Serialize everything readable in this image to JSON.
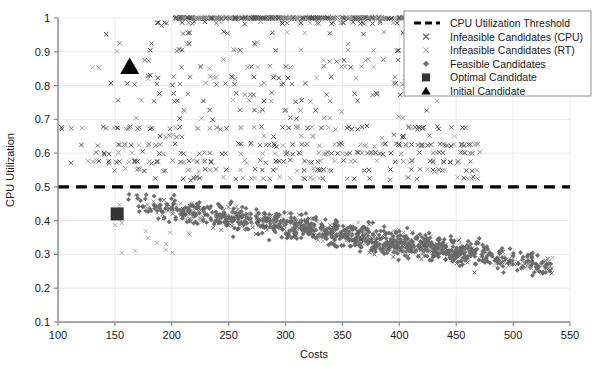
{
  "chart_data": {
    "type": "scatter",
    "title": "",
    "xlabel": "Costs",
    "ylabel": "CPU Utilization",
    "xlim": [
      100,
      550
    ],
    "ylim": [
      0.1,
      1.0
    ],
    "xticks": [
      100,
      150,
      200,
      250,
      300,
      350,
      400,
      450,
      500,
      550
    ],
    "yticks": [
      "0.1",
      "0.2",
      "0.3",
      "0.4",
      "0.5",
      "0.6",
      "0.7",
      "0.8",
      "0.9",
      "1"
    ],
    "grid": true,
    "legend_position": "top-right",
    "threshold": {
      "name": "CPU Utilization Threshold",
      "value": 0.5,
      "style": "dashed",
      "color": "#000000"
    },
    "series": [
      {
        "name": "Infeasible Candidates (CPU)",
        "marker": "x",
        "color": "#555555",
        "note": "Saturated band at y=1.0 plus quantized bands between 0.52 and 0.98"
      },
      {
        "name": "Infeasible Candidates (RT)",
        "marker": "x-light",
        "color": "#8c8c8c",
        "note": "Interspersed with CPU infeasible points, also present below threshold"
      },
      {
        "name": "Feasible Candidates",
        "marker": "diamond",
        "color": "#666666",
        "note": "Dense cloud below the 0.5 threshold, costs 150-535, utilization 0.13-0.50"
      }
    ],
    "highlights": [
      {
        "name": "Optimal Candidate",
        "marker": "square",
        "color": "#333333",
        "x": 152,
        "y": 0.42
      },
      {
        "name": "Initial Candidate",
        "marker": "triangle",
        "color": "#000000",
        "x": 163,
        "y": 0.855
      }
    ]
  },
  "legend": {
    "items": [
      {
        "label": "CPU Utilization Threshold",
        "marker": "dashed-line"
      },
      {
        "label": "Infeasible Candidates (CPU)",
        "marker": "x"
      },
      {
        "label": "Infeasible Candidates (RT)",
        "marker": "x-light"
      },
      {
        "label": "Feasible Candidates",
        "marker": "diamond"
      },
      {
        "label": "Optimal Candidate",
        "marker": "square"
      },
      {
        "label": "Initial Candidate",
        "marker": "triangle"
      }
    ]
  }
}
